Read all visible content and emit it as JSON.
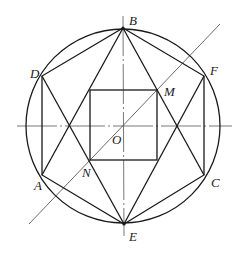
{
  "diagram": {
    "type": "geometry",
    "circle": {
      "cx": 123,
      "cy": 126,
      "r": 97
    },
    "points": {
      "B": {
        "label": "B",
        "x": 123,
        "y": 28
      },
      "E": {
        "label": "E",
        "x": 124,
        "y": 224
      },
      "D": {
        "label": "D",
        "x": 42,
        "y": 76
      },
      "A": {
        "label": "A",
        "x": 42,
        "y": 175
      },
      "F": {
        "label": "F",
        "x": 204,
        "y": 76
      },
      "C": {
        "label": "C",
        "x": 204,
        "y": 175
      },
      "O": {
        "label": "O",
        "x": 123,
        "y": 126
      },
      "M": {
        "label": "M",
        "x": 157,
        "y": 90
      },
      "N": {
        "label": "N",
        "x": 90,
        "y": 160
      }
    },
    "labels": {
      "B": "B",
      "D": "D",
      "F": "F",
      "M": "M",
      "O": "O",
      "N": "N",
      "A": "A",
      "C": "C",
      "E": "E"
    },
    "square": {
      "x1": 90,
      "y1": 90,
      "x2": 157,
      "y2": 160
    },
    "colors": {
      "stroke": "#1a1a1a",
      "axis": "#555555",
      "background": "#ffffff"
    }
  }
}
